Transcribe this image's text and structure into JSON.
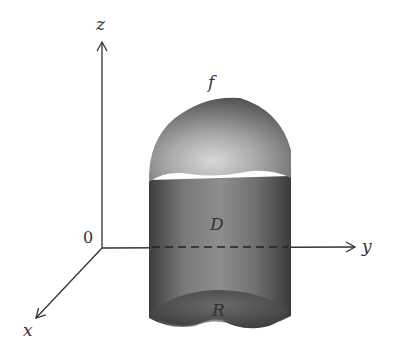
{
  "figure": {
    "type": "3d-solid-under-surface",
    "axes": {
      "z_label": "z",
      "y_label": "y",
      "x_label": "x",
      "origin_label": "0"
    },
    "labels": {
      "surface": "f",
      "solid": "D",
      "region": "R"
    },
    "colors": {
      "axis": "#333333",
      "solid_dark": "#4a4a4a",
      "solid_mid": "#8a8a8a",
      "solid_light": "#c8c8c8",
      "region": "#555555"
    }
  }
}
